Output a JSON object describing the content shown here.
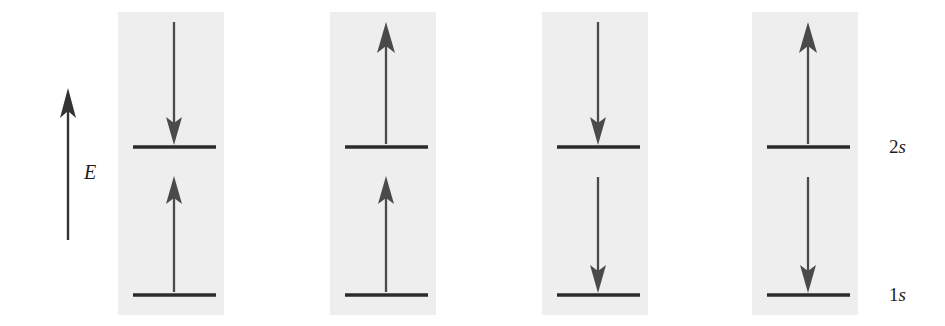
{
  "figure": {
    "width": 945,
    "height": 326,
    "background": "#ffffff",
    "panel_fill": "#efeeee",
    "line_color": "#2b2b2b",
    "arrow_color": "#4a4a4a",
    "axis_color": "#333333"
  },
  "axis": {
    "label": "E",
    "label_meaning": "energy",
    "direction": "up",
    "x": 68,
    "y_top": 90,
    "y_bottom": 240,
    "label_x": 88,
    "label_y": 162
  },
  "levels": [
    {
      "name": "2s",
      "label": "2s",
      "label_number": "2",
      "label_orbital": "s",
      "y": 147
    },
    {
      "name": "1s",
      "label": "1s",
      "label_number": "1",
      "label_orbital": "s",
      "y": 295
    }
  ],
  "level_labels": {
    "x": 890,
    "upper": {
      "number": "2",
      "orbital": "s",
      "y": 136
    },
    "lower": {
      "number": "1",
      "orbital": "s",
      "y": 284
    }
  },
  "geometry": {
    "panel_top": 12,
    "panel_bottom": 315,
    "panel_width": 106,
    "level_line_width": 83,
    "top_arrow_extent_y": 22
  },
  "panels": [
    {
      "index": 1,
      "name": "panel-absorption-emission",
      "x": 118,
      "center_x": 174,
      "arrows": [
        {
          "name": "upper-arrow",
          "direction": "down",
          "from_y": 22,
          "to_y": 144,
          "description": "incoming photon absorbed at 2s level"
        },
        {
          "name": "lower-arrow",
          "direction": "up",
          "from_y": 292,
          "to_y": 177,
          "description": "excitation from 1s to 2s"
        }
      ]
    },
    {
      "index": 2,
      "name": "panel-emission-excitation",
      "x": 330,
      "center_x": 386,
      "arrows": [
        {
          "name": "upper-arrow",
          "direction": "up",
          "from_y": 144,
          "to_y": 22,
          "description": "emission upward from 2s level"
        },
        {
          "name": "lower-arrow",
          "direction": "up",
          "from_y": 292,
          "to_y": 177,
          "description": "excitation from 1s to 2s"
        }
      ]
    },
    {
      "index": 3,
      "name": "panel-absorption-decay",
      "x": 542,
      "center_x": 598,
      "arrows": [
        {
          "name": "upper-arrow",
          "direction": "down",
          "from_y": 22,
          "to_y": 144,
          "description": "incoming photon absorbed at 2s level"
        },
        {
          "name": "lower-arrow",
          "direction": "down",
          "from_y": 177,
          "to_y": 292,
          "description": "decay from 2s to 1s"
        }
      ]
    },
    {
      "index": 4,
      "name": "panel-emission-decay",
      "x": 752,
      "center_x": 808,
      "arrows": [
        {
          "name": "upper-arrow",
          "direction": "up",
          "from_y": 144,
          "to_y": 22,
          "description": "emission upward from 2s level"
        },
        {
          "name": "lower-arrow",
          "direction": "down",
          "from_y": 177,
          "to_y": 292,
          "description": "decay from 2s to 1s"
        }
      ]
    }
  ]
}
